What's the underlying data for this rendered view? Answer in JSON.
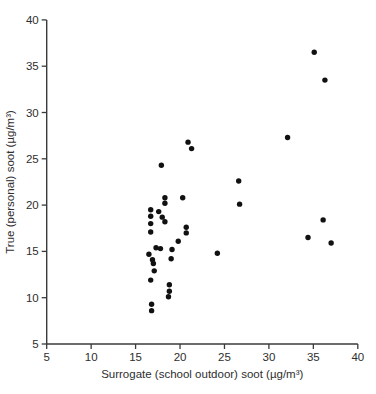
{
  "figure": {
    "background": "#ffffff",
    "width": 376,
    "height": 394
  },
  "chart_data": {
    "type": "scatter",
    "title": "",
    "xlabel": "Surrogate (school outdoor) soot (µg/m³)",
    "ylabel": "True (personal) soot (µg/m³)",
    "xlim": [
      5,
      40
    ],
    "ylim": [
      5,
      40
    ],
    "xticks": [
      5,
      10,
      15,
      20,
      25,
      30,
      35,
      40
    ],
    "yticks": [
      5,
      10,
      15,
      20,
      25,
      30,
      35,
      40
    ],
    "grid": false,
    "legend": null,
    "marker": {
      "shape": "circle",
      "color": "#111111",
      "radius": 2.7
    },
    "axis_color": "#3a3a3a",
    "tick_label_color": "#2e2e2e",
    "points": [
      [
        35.1,
        36.5
      ],
      [
        36.3,
        33.5
      ],
      [
        32.1,
        27.3
      ],
      [
        20.9,
        26.8
      ],
      [
        21.3,
        26.1
      ],
      [
        17.9,
        24.3
      ],
      [
        26.6,
        22.6
      ],
      [
        18.3,
        20.8
      ],
      [
        20.3,
        20.8
      ],
      [
        18.3,
        20.2
      ],
      [
        26.7,
        20.1
      ],
      [
        16.7,
        19.5
      ],
      [
        17.6,
        19.3
      ],
      [
        16.7,
        18.8
      ],
      [
        18.0,
        18.7
      ],
      [
        36.1,
        18.4
      ],
      [
        18.3,
        18.2
      ],
      [
        16.7,
        18.0
      ],
      [
        20.7,
        17.6
      ],
      [
        16.7,
        17.1
      ],
      [
        20.7,
        17.0
      ],
      [
        34.4,
        16.5
      ],
      [
        19.8,
        16.1
      ],
      [
        37.0,
        15.9
      ],
      [
        17.3,
        15.4
      ],
      [
        17.8,
        15.3
      ],
      [
        19.1,
        15.2
      ],
      [
        24.2,
        14.8
      ],
      [
        16.5,
        14.7
      ],
      [
        19.0,
        14.2
      ],
      [
        16.9,
        14.1
      ],
      [
        17.0,
        13.7
      ],
      [
        17.1,
        12.9
      ],
      [
        16.7,
        11.9
      ],
      [
        18.8,
        11.4
      ],
      [
        18.8,
        10.7
      ],
      [
        18.7,
        10.1
      ],
      [
        16.8,
        9.3
      ],
      [
        16.8,
        8.6
      ]
    ]
  }
}
